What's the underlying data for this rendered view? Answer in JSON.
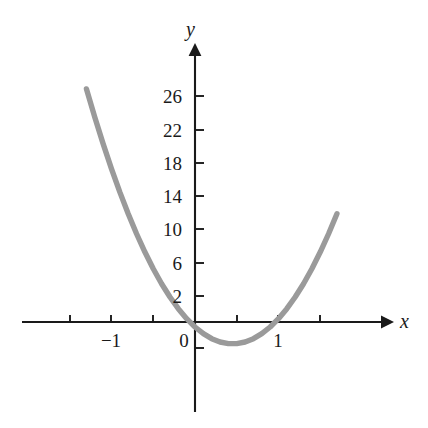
{
  "chart_data": {
    "type": "line",
    "title": "",
    "subtitle": "",
    "xlabel": "x",
    "ylabel": "y",
    "function": "y = 16x^2 - 10x - 4",
    "curve_color": "#9a9a9a",
    "axis_color": "#1a1a1a",
    "background_color": "#ffffff",
    "grid": false,
    "legend": null,
    "xlim": [
      -1.75,
      1.9
    ],
    "ylim": [
      -5.5,
      29
    ],
    "x_ticks": [
      -1.5,
      -1,
      -0.5,
      0,
      0.5,
      1,
      1.5
    ],
    "x_tick_labels": [
      "",
      "−1",
      "",
      "0",
      "",
      "1",
      ""
    ],
    "y_ticks": [
      2,
      6,
      10,
      14,
      18,
      22,
      26
    ],
    "y_tick_labels": [
      "2",
      "6",
      "10",
      "14",
      "18",
      "22",
      "26"
    ],
    "x_roots": [
      -0.4,
      1.0
    ],
    "vertex": [
      0.3,
      -3.0
    ],
    "points": [
      {
        "x": -1.3,
        "y": 28.0
      },
      {
        "x": -1.2,
        "y": 24.6
      },
      {
        "x": -1.1,
        "y": 21.4
      },
      {
        "x": -1.0,
        "y": 18.4
      },
      {
        "x": -0.9,
        "y": 15.6
      },
      {
        "x": -0.8,
        "y": 13.0
      },
      {
        "x": -0.7,
        "y": 10.6
      },
      {
        "x": -0.6,
        "y": 8.4
      },
      {
        "x": -0.5,
        "y": 6.4
      },
      {
        "x": -0.4,
        "y": 4.6
      },
      {
        "x": -0.3,
        "y": 3.0
      },
      {
        "x": -0.2,
        "y": 1.6
      },
      {
        "x": -0.1,
        "y": 0.4
      },
      {
        "x": 0.0,
        "y": -0.6
      },
      {
        "x": 0.1,
        "y": -1.4
      },
      {
        "x": 0.2,
        "y": -2.0
      },
      {
        "x": 0.3,
        "y": -2.4
      },
      {
        "x": 0.4,
        "y": -2.6
      },
      {
        "x": 0.5,
        "y": -2.6
      },
      {
        "x": 0.6,
        "y": -2.4
      },
      {
        "x": 0.7,
        "y": -2.0
      },
      {
        "x": 0.8,
        "y": -1.4
      },
      {
        "x": 0.9,
        "y": -0.6
      },
      {
        "x": 1.0,
        "y": 0.4
      },
      {
        "x": 1.1,
        "y": 1.6
      },
      {
        "x": 1.2,
        "y": 3.0
      },
      {
        "x": 1.3,
        "y": 4.6
      },
      {
        "x": 1.4,
        "y": 6.4
      },
      {
        "x": 1.5,
        "y": 8.4
      },
      {
        "x": 1.6,
        "y": 10.6
      },
      {
        "x": 1.7,
        "y": 13.0
      }
    ]
  },
  "axes": {
    "x_axis_name": "x",
    "y_axis_name": "y"
  },
  "labels": {
    "y": [
      "26",
      "22",
      "18",
      "14",
      "10",
      "6",
      "2"
    ],
    "x_left": "−1",
    "x_origin": "0",
    "x_right": "1"
  }
}
